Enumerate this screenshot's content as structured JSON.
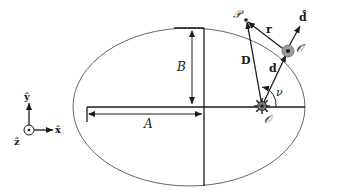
{
  "diagram": {
    "type": "orbital-geometry",
    "colors": {
      "stroke": "#1a1a1a",
      "ellipse": "#555555",
      "body_fill": "#9a9a9a"
    },
    "axes": {
      "y_label": "ŷ",
      "x_label": "x̂",
      "z_label": "ẑ"
    },
    "labels": {
      "semi_major": "A",
      "semi_minor": "B",
      "point_P": "𝒫",
      "origin": "𝒪",
      "origin_prime": "𝒪′",
      "vector_r": "r",
      "vector_D": "D",
      "vector_d": "d",
      "unit_d": "d̂",
      "angle_nu": "ν"
    }
  }
}
